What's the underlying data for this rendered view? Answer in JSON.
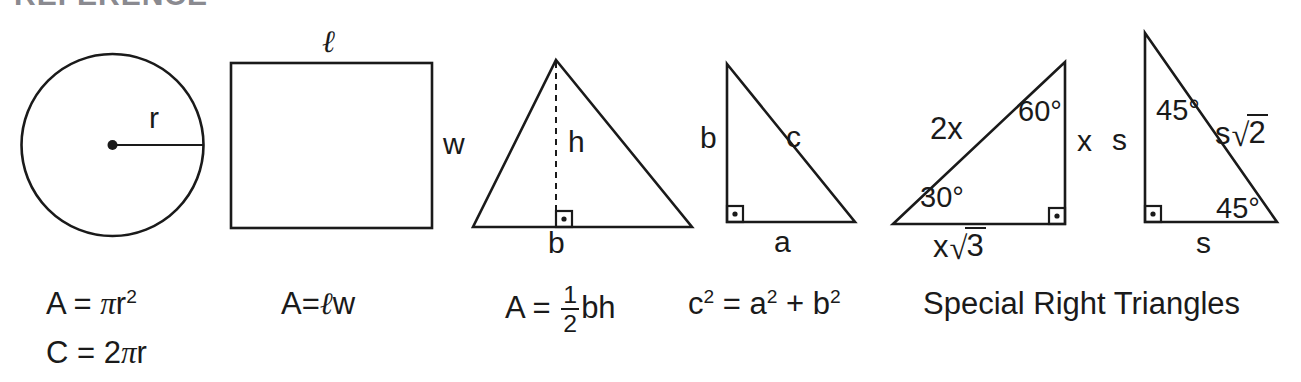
{
  "page": {
    "title_partial": "REFERENCE",
    "background": "#ffffff",
    "ink": "#1a1a1a"
  },
  "figures": {
    "circle": {
      "name": "circle",
      "radius_label": "r",
      "formulas": [
        {
          "lhs": "A",
          "eq": "=",
          "rhs_pi": "π",
          "rhs_var": "r",
          "rhs_exp": "2",
          "full": "A = πr²"
        },
        {
          "lhs": "C",
          "eq": "=",
          "coef": "2",
          "rhs_pi": "π",
          "rhs_var": "r",
          "full": "C = 2πr"
        }
      ]
    },
    "rectangle": {
      "name": "rectangle",
      "length_label": "ℓ",
      "width_label": "w",
      "formula": {
        "lhs": "A=",
        "ell": "ℓ",
        "w": "w",
        "full": "A=ℓw"
      }
    },
    "triangle": {
      "name": "triangle",
      "height_label": "h",
      "base_label": "b",
      "right_angle": "right-angle-marker",
      "formula": {
        "lhs": "A",
        "eq": "=",
        "num": "1",
        "den": "2",
        "rest": "bh",
        "full": "A = 1/2 bh"
      }
    },
    "right_triangle": {
      "name": "right-triangle",
      "leg_vertical_label": "b",
      "leg_horizontal_label": "a",
      "hypotenuse_label": "c",
      "right_angle": "right-angle-marker",
      "formula": {
        "c": "c",
        "c_exp": "2",
        "eq": "=",
        "a": "a",
        "a_exp": "2",
        "plus": "+",
        "b": "b",
        "b_exp": "2",
        "full": "c² = a² + b²"
      }
    },
    "special_30_60_90": {
      "name": "triangle-30-60-90",
      "hypotenuse_label": "2x",
      "vertical_leg_label": "x",
      "base_prefix": "x",
      "base_radicand": "3",
      "base_label": "x√3",
      "angle_bottom_left": "30°",
      "angle_top_right": "60°",
      "right_angle": "right-angle-marker"
    },
    "special_45_45_90": {
      "name": "triangle-45-45-90",
      "vertical_leg_label": "s",
      "base_label": "s",
      "hypotenuse_prefix": "s",
      "hypotenuse_radicand": "2",
      "hypotenuse_label": "s√2",
      "angle_top": "45°",
      "angle_bottom": "45°",
      "right_angle": "right-angle-marker"
    }
  },
  "captions": {
    "special_right_triangles": "Special Right Triangles"
  },
  "symbols": {
    "radical": "√",
    "degree": "°",
    "pi": "π"
  }
}
